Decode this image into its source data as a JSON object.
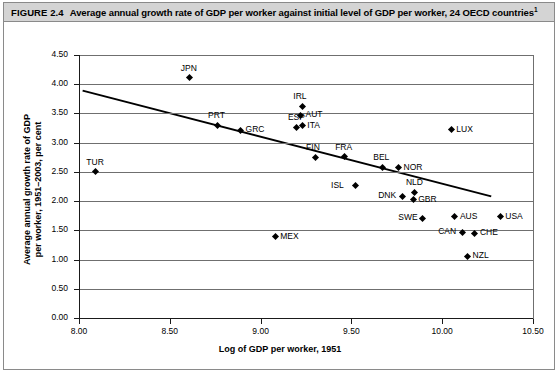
{
  "figure": {
    "label": "FIGURE 2.4",
    "caption": "Average annual growth rate of GDP per worker against initial level of GDP per worker, 24 OECD countries",
    "footnote_marker": "1"
  },
  "chart_data": {
    "type": "scatter",
    "title": "Average annual growth rate of GDP per worker against initial level of GDP per worker, 24 OECD countries",
    "xlabel": "Log of GDP per worker, 1951",
    "ylabel": "Average annual growth rate of GDP per worker, 1951–2003, per cent",
    "ylabel_line1": "Average annual growth rate of GDP",
    "ylabel_line2": "per worker, 1951–2003, per cent",
    "xlim": [
      8.0,
      10.5
    ],
    "ylim": [
      0.0,
      4.5
    ],
    "xticks": [
      "8.00",
      "8.50",
      "9.00",
      "9.50",
      "10.00",
      "10.50"
    ],
    "xtick_values": [
      8.0,
      8.5,
      9.0,
      9.5,
      10.0,
      10.5
    ],
    "yticks": [
      "0.00",
      "0.50",
      "1.00",
      "1.50",
      "2.00",
      "2.50",
      "3.00",
      "3.50",
      "4.00",
      "4.50"
    ],
    "ytick_values": [
      0.0,
      0.5,
      1.0,
      1.5,
      2.0,
      2.5,
      3.0,
      3.5,
      4.0,
      4.5
    ],
    "grid": "horizontal",
    "legend": "none",
    "marker_shape": "diamond",
    "marker_color": "#000000",
    "trendline": {
      "type": "linear-fit",
      "x_start": 8.02,
      "y_start": 3.89,
      "x_end": 10.27,
      "y_end": 2.08,
      "color": "#000000"
    },
    "points": [
      {
        "label": "TUR",
        "x": 8.09,
        "y": 2.5,
        "label_pos": "above"
      },
      {
        "label": "JPN",
        "x": 8.61,
        "y": 4.11,
        "label_pos": "above"
      },
      {
        "label": "PRT",
        "x": 8.76,
        "y": 3.3,
        "label_pos": "above"
      },
      {
        "label": "GRC",
        "x": 8.89,
        "y": 3.21,
        "label_pos": "right"
      },
      {
        "label": "MEX",
        "x": 9.08,
        "y": 1.39,
        "label_pos": "right"
      },
      {
        "label": "ESP",
        "x": 9.2,
        "y": 3.26,
        "label_pos": "above"
      },
      {
        "label": "IRL",
        "x": 9.23,
        "y": 3.62,
        "label_pos": "above"
      },
      {
        "label": "AUT",
        "x": 9.22,
        "y": 3.47,
        "label_pos": "right"
      },
      {
        "label": "ITA",
        "x": 9.23,
        "y": 3.29,
        "label_pos": "right"
      },
      {
        "label": "FIN",
        "x": 9.3,
        "y": 2.75,
        "label_pos": "above"
      },
      {
        "label": "FRA",
        "x": 9.46,
        "y": 2.76,
        "label_pos": "above"
      },
      {
        "label": "ISL",
        "x": 9.52,
        "y": 2.26,
        "label_pos": "left"
      },
      {
        "label": "BEL",
        "x": 9.67,
        "y": 2.58,
        "label_pos": "above"
      },
      {
        "label": "NOR",
        "x": 9.76,
        "y": 2.57,
        "label_pos": "right"
      },
      {
        "label": "DNK",
        "x": 9.78,
        "y": 2.08,
        "label_pos": "left"
      },
      {
        "label": "NLD",
        "x": 9.85,
        "y": 2.15,
        "label_pos": "above"
      },
      {
        "label": "GBR",
        "x": 9.84,
        "y": 2.02,
        "label_pos": "right"
      },
      {
        "label": "SWE",
        "x": 9.89,
        "y": 1.71,
        "label_pos": "left"
      },
      {
        "label": "AUS",
        "x": 10.07,
        "y": 1.73,
        "label_pos": "right"
      },
      {
        "label": "LUX",
        "x": 10.05,
        "y": 3.22,
        "label_pos": "right"
      },
      {
        "label": "CAN",
        "x": 10.11,
        "y": 1.47,
        "label_pos": "left"
      },
      {
        "label": "CHE",
        "x": 10.18,
        "y": 1.45,
        "label_pos": "right"
      },
      {
        "label": "NZL",
        "x": 10.14,
        "y": 1.06,
        "label_pos": "right"
      },
      {
        "label": "USA",
        "x": 10.32,
        "y": 1.73,
        "label_pos": "right"
      }
    ]
  }
}
